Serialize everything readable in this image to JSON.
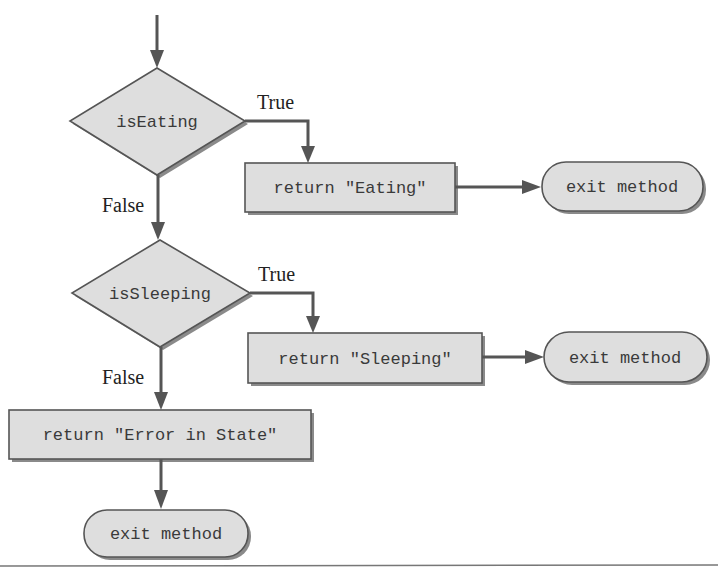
{
  "diagram": {
    "type": "flowchart",
    "decisions": [
      {
        "id": "d1",
        "label": "isEating",
        "true_label": "True",
        "false_label": "False"
      },
      {
        "id": "d2",
        "label": "isSleeping",
        "true_label": "True",
        "false_label": "False"
      }
    ],
    "processes": [
      {
        "id": "p1",
        "label": "return \"Eating\""
      },
      {
        "id": "p2",
        "label": "return \"Sleeping\""
      },
      {
        "id": "p3",
        "label": "return \"Error in State\""
      }
    ],
    "terminals": [
      {
        "id": "t1",
        "label": "exit method"
      },
      {
        "id": "t2",
        "label": "exit method"
      },
      {
        "id": "t3",
        "label": "exit method"
      }
    ],
    "edges": [
      {
        "from": "start",
        "to": "d1"
      },
      {
        "from": "d1",
        "to": "p1",
        "label": "True"
      },
      {
        "from": "p1",
        "to": "t1"
      },
      {
        "from": "d1",
        "to": "d2",
        "label": "False"
      },
      {
        "from": "d2",
        "to": "p2",
        "label": "True"
      },
      {
        "from": "p2",
        "to": "t2"
      },
      {
        "from": "d2",
        "to": "p3",
        "label": "False"
      },
      {
        "from": "p3",
        "to": "t3"
      }
    ]
  }
}
